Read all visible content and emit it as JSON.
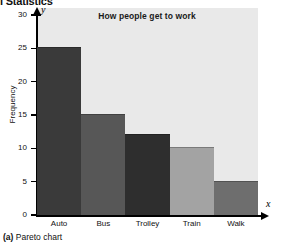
{
  "page": {
    "running_header": "l Statistics",
    "caption_label": "(a)",
    "caption_text": "Pareto chart"
  },
  "chart_data": {
    "type": "bar",
    "title": "How people get to work",
    "xlabel": "x",
    "ylabel": "Frequency",
    "categories": [
      "Auto",
      "Bus",
      "Trolley",
      "Train",
      "Walk"
    ],
    "values": [
      25,
      15,
      12,
      10,
      5
    ],
    "ylim": [
      0,
      30
    ],
    "yticks": [
      0,
      5,
      10,
      15,
      20,
      25,
      30
    ],
    "ytick_labels": [
      "0",
      "5",
      "10",
      "15",
      "20",
      "25",
      "30"
    ],
    "grid": false,
    "legend": "none",
    "axis_letter_x": "x",
    "axis_letter_y": "y",
    "bar_colors": [
      "#3a3a3a",
      "#575757",
      "#2e2e2e",
      "#a3a3a3",
      "#6e6e6e"
    ],
    "panel_color": "#e9e9e9",
    "axis_color": "#000000"
  }
}
